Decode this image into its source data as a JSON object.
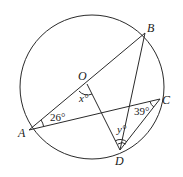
{
  "diagram": {
    "type": "circle-geometry",
    "circle": {
      "center_label": "O"
    },
    "points": {
      "A": "A",
      "B": "B",
      "C": "C",
      "D": "D",
      "O": "O"
    },
    "segments": [
      "AB",
      "OD",
      "AC",
      "BD",
      "CD"
    ],
    "angles": {
      "OAC": "26°",
      "ACD": "39°",
      "AOD": "x°",
      "BDC": "y°"
    },
    "angle_labels": {
      "x_var": "x",
      "y_var": "y",
      "deg": "°",
      "a26": "26°",
      "a39": "39°"
    }
  }
}
